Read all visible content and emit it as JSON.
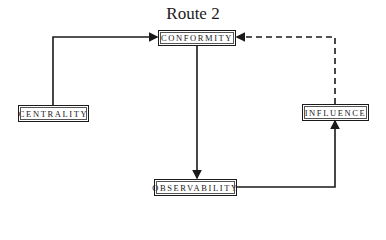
{
  "title": "Route 2",
  "nodes": {
    "conformity": "CONFORMITY",
    "centrality": "CENTRALITY",
    "influence": "INFLUENCE",
    "observability": "OBSERVABILITY"
  },
  "edges": [
    {
      "from": "CENTRALITY",
      "to": "CONFORMITY",
      "style": "solid"
    },
    {
      "from": "CONFORMITY",
      "to": "OBSERVABILITY",
      "style": "solid"
    },
    {
      "from": "OBSERVABILITY",
      "to": "INFLUENCE",
      "style": "solid"
    },
    {
      "from": "INFLUENCE",
      "to": "CONFORMITY",
      "style": "dashed"
    }
  ],
  "colors": {
    "line": "#1a1a1a",
    "background": "#ffffff"
  }
}
